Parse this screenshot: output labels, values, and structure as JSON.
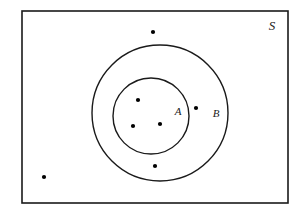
{
  "figure": {
    "name": "set-diagram",
    "background_color": "#ffffff",
    "stroke_color": "#1a1a1a",
    "dot_color": "#000000"
  },
  "labels": {
    "universe": "S",
    "set_a": "A",
    "set_b": "B"
  },
  "shapes": {
    "universe_rect": {
      "x": 22,
      "y": 11,
      "width": 266,
      "height": 192,
      "stroke_width": 1.6
    },
    "circle_b": {
      "cx": 160,
      "cy": 113,
      "r": 68,
      "stroke_width": 1.4
    },
    "circle_a": {
      "cx": 151,
      "cy": 116,
      "r": 38,
      "stroke_width": 1.4
    }
  },
  "label_positions": {
    "universe": {
      "x": 272,
      "y": 30
    },
    "set_a": {
      "x": 178,
      "y": 115
    },
    "set_b": {
      "x": 216,
      "y": 117
    }
  },
  "points": [
    {
      "id": "point-1",
      "x": 138,
      "y": 100,
      "r": 2.1,
      "region": "inside-A"
    },
    {
      "id": "point-2",
      "x": 133,
      "y": 126,
      "r": 2.1,
      "region": "inside-A"
    },
    {
      "id": "point-3",
      "x": 160,
      "y": 124,
      "r": 2.1,
      "region": "inside-A"
    },
    {
      "id": "point-4",
      "x": 196,
      "y": 108,
      "r": 2.1,
      "region": "B-outside-A"
    },
    {
      "id": "point-5",
      "x": 155,
      "y": 166,
      "r": 2.1,
      "region": "B-outside-A"
    },
    {
      "id": "point-6",
      "x": 153,
      "y": 32,
      "r": 2.1,
      "region": "S-outside-B"
    },
    {
      "id": "point-7",
      "x": 44,
      "y": 177,
      "r": 2.1,
      "region": "S-outside-B"
    }
  ]
}
